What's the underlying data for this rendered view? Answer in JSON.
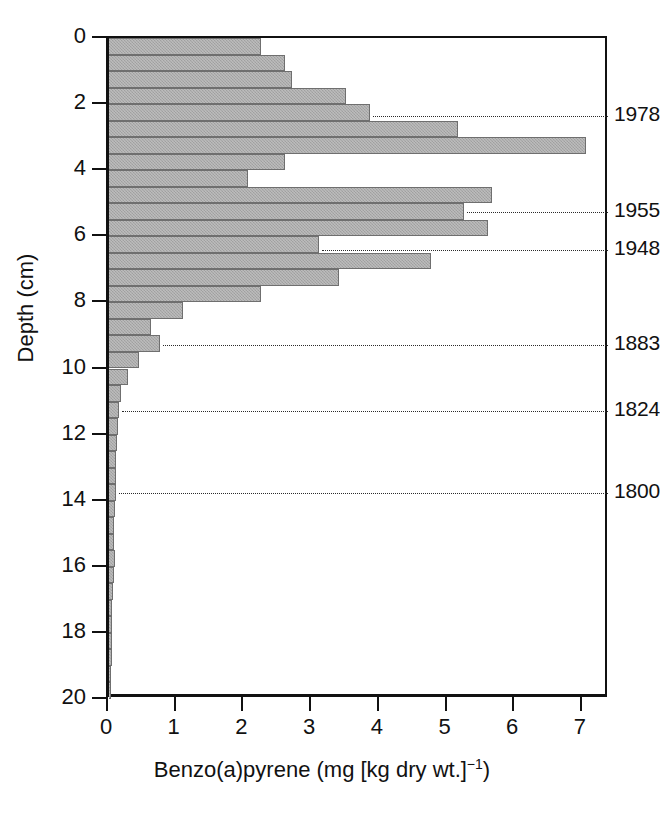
{
  "chart_data": {
    "type": "bar",
    "orientation": "horizontal",
    "title": "",
    "xlabel": "Benzo(a)pyrene (mg [kg dry wt.]",
    "xlabel_exponent": "−1",
    "xlabel_suffix": ")",
    "ylabel": "Depth (cm)",
    "xlim": [
      0,
      7.4
    ],
    "ylim": [
      0,
      20
    ],
    "xticks": [
      0,
      1,
      2,
      3,
      4,
      5,
      6,
      7
    ],
    "xticklabels": [
      "0",
      "1",
      "2",
      "3",
      "4",
      "5",
      "6",
      "7"
    ],
    "yticks": [
      0,
      2,
      4,
      6,
      8,
      10,
      12,
      14,
      16,
      18,
      20
    ],
    "yticklabels": [
      "0",
      "2",
      "4",
      "6",
      "8",
      "10",
      "12",
      "14",
      "16",
      "18",
      "20"
    ],
    "grid": false,
    "legend": null,
    "bar_color": "#a9a9a9",
    "bar_edge_color": "#6f6f6f",
    "depth_bin_cm": 0.5,
    "categories": [
      "0.0-0.5",
      "0.5-1.0",
      "1.0-1.5",
      "1.5-2.0",
      "2.0-2.5",
      "2.5-3.0",
      "3.0-3.5",
      "3.5-4.0",
      "4.0-4.5",
      "4.5-5.0",
      "5.0-5.5",
      "5.5-6.0",
      "6.0-6.5",
      "6.5-7.0",
      "7.0-7.5",
      "7.5-8.0",
      "8.0-8.5",
      "8.5-9.0",
      "9.0-9.5",
      "9.5-10.0",
      "10.0-10.5",
      "10.5-11.0",
      "11.0-11.5",
      "11.5-12.0",
      "12.0-12.5",
      "12.5-13.0",
      "13.0-13.5",
      "13.5-14.0",
      "14.0-14.5",
      "14.5-15.0",
      "15.0-15.5",
      "15.5-16.0",
      "16.0-16.5",
      "16.5-17.0",
      "17.0-17.5",
      "17.5-18.0",
      "18.0-18.5",
      "18.5-19.0",
      "19.0-19.5",
      "19.5-20.0"
    ],
    "depth_top_cm": [
      0.0,
      0.5,
      1.0,
      1.5,
      2.0,
      2.5,
      3.0,
      3.5,
      4.0,
      4.5,
      5.0,
      5.5,
      6.0,
      6.5,
      7.0,
      7.5,
      8.0,
      8.5,
      9.0,
      9.5,
      10.0,
      10.5,
      11.0,
      11.5,
      12.0,
      12.5,
      13.0,
      13.5,
      14.0,
      14.5,
      15.0,
      15.5,
      16.0,
      16.5,
      17.0,
      17.5,
      18.0,
      18.5,
      19.0,
      19.5
    ],
    "values": [
      2.25,
      2.6,
      2.7,
      3.5,
      3.85,
      5.15,
      7.05,
      2.6,
      2.05,
      5.65,
      5.25,
      5.6,
      3.1,
      4.75,
      3.4,
      2.25,
      1.1,
      0.62,
      0.75,
      0.45,
      0.28,
      0.18,
      0.15,
      0.13,
      0.12,
      0.11,
      0.1,
      0.1,
      0.09,
      0.08,
      0.07,
      0.09,
      0.07,
      0.06,
      0.05,
      0.05,
      0.04,
      0.04,
      0.03,
      0.03
    ],
    "annotations": [
      {
        "label": "1978",
        "depth_cm": 2.36
      },
      {
        "label": "1955",
        "depth_cm": 5.25
      },
      {
        "label": "1948",
        "depth_cm": 6.42
      },
      {
        "label": "1883",
        "depth_cm": 9.28
      },
      {
        "label": "1824",
        "depth_cm": 11.3
      },
      {
        "label": "1800",
        "depth_cm": 13.78
      }
    ]
  }
}
